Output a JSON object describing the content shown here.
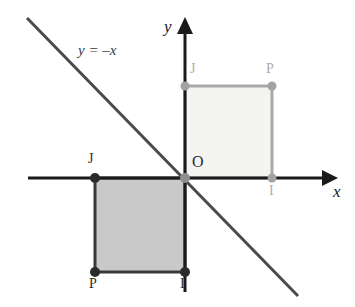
{
  "figure": {
    "background_color": "#ffffff",
    "axes": {
      "x_axis": {
        "label": "x",
        "color": "#1a1a1a",
        "start": [
          28,
          178
        ],
        "end": [
          330,
          178
        ],
        "arrow": "right"
      },
      "y_axis": {
        "label": "y",
        "color": "#1a1a1a",
        "start": [
          185,
          290
        ],
        "end": [
          185,
          22
        ],
        "arrow": "up"
      },
      "origin": {
        "label": "O",
        "point": [
          185,
          178
        ]
      }
    },
    "line": {
      "equation_label": "y = –x",
      "color": "#4a4a4a",
      "start": [
        27,
        18
      ],
      "end": [
        298,
        296
      ],
      "width": 3
    },
    "squares": [
      {
        "name": "image-square",
        "description": "light square in first quadrant",
        "fill": "#f4f4f2",
        "stroke": "#a9a9a9",
        "stroke_width": 3,
        "x": 185,
        "y": 86,
        "width": 87,
        "height": 92,
        "vertices": [
          {
            "label": "O",
            "x": 185,
            "y": 178,
            "dot": true,
            "tone": "light"
          },
          {
            "label": "J",
            "x": 185,
            "y": 86,
            "dot": true,
            "tone": "light"
          },
          {
            "label": "P",
            "x": 272,
            "y": 86,
            "dot": true,
            "tone": "light"
          },
          {
            "label": "I",
            "x": 272,
            "y": 178,
            "dot": true,
            "tone": "light"
          }
        ]
      },
      {
        "name": "source-square",
        "description": "shaded square in third quadrant",
        "fill": "#c9c9c9",
        "stroke": "#3a3a3a",
        "stroke_width": 3,
        "x": 95,
        "y": 178,
        "width": 90,
        "height": 94,
        "vertices": [
          {
            "label": "J",
            "x": 95,
            "y": 178,
            "dot": true,
            "tone": "dark"
          },
          {
            "label": "O",
            "x": 185,
            "y": 178,
            "dot": true,
            "tone": "dark"
          },
          {
            "label": "P",
            "x": 95,
            "y": 272,
            "dot": true,
            "tone": "dark"
          },
          {
            "label": "I",
            "x": 185,
            "y": 272,
            "dot": true,
            "tone": "dark"
          }
        ]
      }
    ],
    "labels": {
      "y_axis": "y",
      "x_axis": "x",
      "origin": "O",
      "line_equation": "y = –x",
      "upper_j": "J",
      "upper_p": "P",
      "upper_i": "I",
      "lower_j": "J",
      "lower_p": "P",
      "lower_i": "I"
    }
  }
}
